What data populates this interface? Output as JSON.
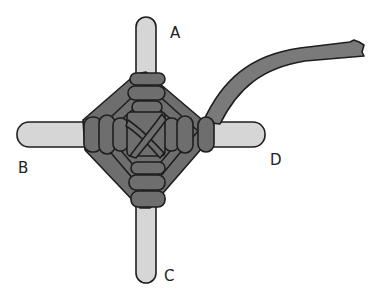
{
  "figure": {
    "labels": {
      "top": "A",
      "left": "B",
      "bottom": "C",
      "right": "D"
    },
    "colors": {
      "background": "#ffffff",
      "stick": "#d6d6d6",
      "yarn": "#6e6e6e",
      "yarn_tail": "#7a7a7a",
      "outline": "#1e1e1e"
    }
  }
}
